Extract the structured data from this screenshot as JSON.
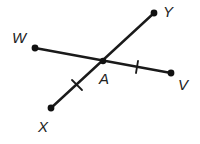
{
  "diagram": {
    "type": "intersecting-segments",
    "colors": {
      "line": "#1a1a1a",
      "point": "#111111",
      "label": "#222222",
      "background": "#ffffff"
    },
    "points": {
      "W": {
        "label": "W",
        "x": 35,
        "y": 48,
        "label_x": 12,
        "label_y": 43
      },
      "V": {
        "label": "V",
        "x": 171,
        "y": 73,
        "label_x": 178,
        "label_y": 90
      },
      "X": {
        "label": "X",
        "x": 51,
        "y": 108,
        "label_x": 38,
        "label_y": 132
      },
      "Y": {
        "label": "Y",
        "x": 154,
        "y": 13,
        "label_x": 163,
        "label_y": 17
      },
      "A": {
        "label": "A",
        "x": 103,
        "y": 61,
        "label_x": 99,
        "label_y": 84
      }
    },
    "segments": [
      {
        "name": "WV",
        "from": "W",
        "to": "V"
      },
      {
        "name": "XY",
        "from": "X",
        "to": "Y"
      }
    ],
    "congruence_marks": [
      {
        "segment": "AX",
        "ticks": 1
      },
      {
        "segment": "AV",
        "ticks": 1
      }
    ]
  }
}
